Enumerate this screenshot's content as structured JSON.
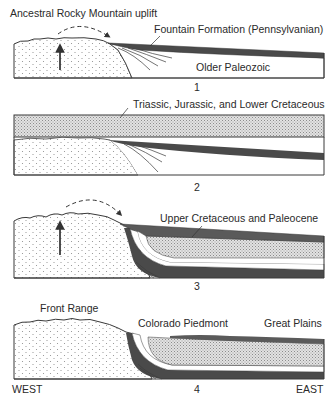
{
  "figure": {
    "panels": [
      {
        "number": "1",
        "labels": {
          "uplift": "Ancestral Rocky Mountain uplift",
          "fountain": "Fountain Formation (Pennsylvanian)",
          "older": "Older Paleozoic"
        }
      },
      {
        "number": "2",
        "labels": {
          "mesozoic": "Triassic, Jurassic, and Lower Cretaceous"
        }
      },
      {
        "number": "3",
        "labels": {
          "upper": "Upper Cretaceous and Paleocene"
        }
      },
      {
        "number": "4",
        "labels": {
          "front_range": "Front Range",
          "piedmont": "Colorado Piedmont",
          "plains": "Great Plains"
        }
      }
    ],
    "directions": {
      "west": "WEST",
      "east": "EAST"
    },
    "colors": {
      "outline": "#3a3a3a",
      "dark_layer": "#4a4a4a",
      "stipple_fill": "#d4d4d4",
      "basement_dots": "#8a8a8a"
    }
  }
}
